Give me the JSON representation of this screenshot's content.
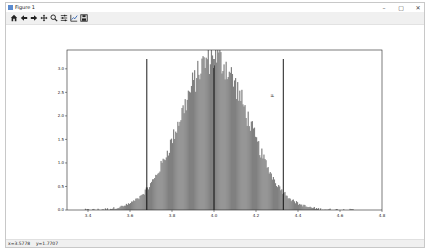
{
  "window": {
    "title": "Figure 1",
    "controls": {
      "minimize": "–",
      "maximize": "▢",
      "close": "✕"
    }
  },
  "toolbar": {
    "buttons": [
      {
        "name": "home",
        "icon": "home-icon",
        "tooltip": "Reset original view"
      },
      {
        "name": "back",
        "icon": "arrow-left-icon",
        "tooltip": "Back"
      },
      {
        "name": "forward",
        "icon": "arrow-right-icon",
        "tooltip": "Forward"
      },
      {
        "name": "pan",
        "icon": "move-icon",
        "tooltip": "Pan"
      },
      {
        "name": "zoom",
        "icon": "magnifier-icon",
        "tooltip": "Zoom"
      },
      {
        "name": "subplots",
        "icon": "sliders-icon",
        "tooltip": "Configure subplots"
      },
      {
        "name": "edit",
        "icon": "line-chart-icon",
        "tooltip": "Edit axis"
      },
      {
        "name": "save",
        "icon": "floppy-disk-icon",
        "tooltip": "Save"
      }
    ]
  },
  "status": {
    "text": "x=3.5778    y=1.7707"
  },
  "chart_data": {
    "type": "bar",
    "title": "",
    "xlabel": "",
    "ylabel": "",
    "xlim": [
      3.3,
      4.8
    ],
    "ylim": [
      0.0,
      3.4
    ],
    "xticks": [
      3.4,
      3.6,
      3.8,
      4.0,
      4.2,
      4.4,
      4.6,
      4.8
    ],
    "xtick_labels": [
      "3.4",
      "3.6",
      "3.8",
      "4.0",
      "4.2",
      "4.4",
      "4.6",
      "4.8"
    ],
    "yticks": [
      0.0,
      0.5,
      1.0,
      1.5,
      2.0,
      2.5,
      3.0
    ],
    "ytick_labels": [
      "0.0",
      "0.5",
      "1.0",
      "1.5",
      "2.0",
      "2.5",
      "3.0"
    ],
    "grid": false,
    "histogram": {
      "description": "density histogram of approximately normal samples",
      "mean": 4.0,
      "std": 0.16,
      "peak_density": 3.25,
      "bin_width": 0.005,
      "range": [
        3.38,
        4.66
      ],
      "color": "#808080"
    },
    "vlines": [
      {
        "x": 3.68,
        "color": "#000000",
        "label": "lower"
      },
      {
        "x": 4.0,
        "color": "#000000",
        "label": "mean"
      },
      {
        "x": 4.33,
        "color": "#000000",
        "label": "upper"
      }
    ],
    "annotation": {
      "text": "μ",
      "x": 4.28,
      "y": 2.4,
      "rotation": 90
    }
  }
}
